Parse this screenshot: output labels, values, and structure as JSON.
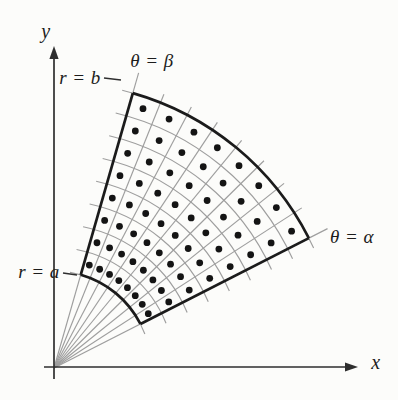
{
  "figure": {
    "background": "#fcfcfa",
    "canvas": {
      "width": 398,
      "height": 400
    },
    "origin": {
      "x": 54,
      "y": 368
    },
    "axes": {
      "color": "#2e2e2e",
      "width": 1.7,
      "arrow_len": 13,
      "arrow_half_width": 4.6,
      "x_axis": {
        "from_x": 44,
        "to_x": 358,
        "y": 367
      },
      "y_axis": {
        "from_y": 379,
        "to_y": 46,
        "x": 54
      }
    },
    "region": {
      "inner_radius": 97,
      "outer_radius": 286,
      "alpha_deg": 27,
      "beta_deg": 74,
      "n_radial": 8,
      "n_angular": 8,
      "boundary_color": "#1b1b1b",
      "boundary_width": 2.7,
      "grid_color": "#9e9e9e",
      "grid_width": 1.15,
      "dot_color": "#141414",
      "dot_radius": 3.4,
      "ray_overhang": 9,
      "boundary_ray_overhang": 21,
      "arc_overhang": 11
    },
    "labels": {
      "y_axis": {
        "text": "y",
        "x": 46,
        "y": 31
      },
      "x_axis": {
        "text": "x",
        "x": 376,
        "y": 362
      },
      "theta_beta": {
        "text": "θ = β",
        "x": 152,
        "y": 60
      },
      "theta_alpha": {
        "text": "θ = α",
        "x": 352,
        "y": 236
      },
      "r_b": {
        "text": "r = b",
        "x": 80,
        "y": 77
      },
      "r_a": {
        "text": "r = a",
        "x": 39,
        "y": 271
      }
    },
    "pointer_dashes": [
      {
        "x1": 104,
        "y1": 78,
        "x2": 121,
        "y2": 80
      },
      {
        "x1": 63,
        "y1": 273,
        "x2": 77,
        "y2": 275
      }
    ],
    "dash_color": "#2e2e2e",
    "dash_width": 1.4
  }
}
